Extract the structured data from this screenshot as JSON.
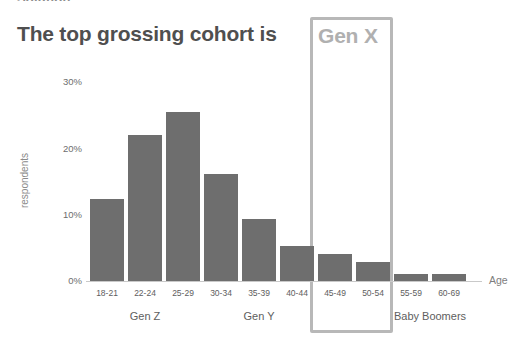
{
  "page": {
    "cut_off_heading": "Solution:",
    "title": "The top grossing cohort is",
    "highlight_label": "Gen X"
  },
  "colors": {
    "title": "#4f4f4f",
    "bar": "#6e6e6e",
    "highlight_box": "#b8b8b8",
    "highlight_text": "#b0b0b0",
    "axis": "#c9c9c9",
    "tick_text": "#5e5e5e",
    "background": "#ffffff"
  },
  "chart_data": {
    "type": "bar",
    "title": "The top grossing cohort is Gen X",
    "xlabel": "Age",
    "ylabel": "respondents",
    "categories": [
      "18-21",
      "22-24",
      "25-29",
      "30-34",
      "35-39",
      "40-44",
      "45-49",
      "50-54",
      "55-59",
      "60-69"
    ],
    "values": [
      12.4,
      22.0,
      25.6,
      16.2,
      9.4,
      5.3,
      4.1,
      2.9,
      1.1,
      1.1
    ],
    "ylim": [
      0,
      32
    ],
    "yticks": [
      "0%",
      "10%",
      "20%",
      "30%"
    ],
    "ytick_values": [
      0,
      10,
      20,
      30
    ],
    "grid": false,
    "legend": "none",
    "groups": [
      {
        "label": "Gen Z",
        "categories": [
          "18-21",
          "22-24",
          "25-29"
        ]
      },
      {
        "label": "Gen Y",
        "categories": [
          "30-34",
          "35-39",
          "40-44"
        ]
      },
      {
        "label": "Gen X",
        "categories": [
          "45-49",
          "50-54"
        ],
        "highlighted": true
      },
      {
        "label": "Baby Boomers",
        "categories": [
          "55-59",
          "60-69"
        ]
      }
    ],
    "annotations": [
      {
        "text": "Gen X",
        "type": "highlight-box",
        "covers": [
          "45-49",
          "50-54"
        ]
      }
    ]
  }
}
